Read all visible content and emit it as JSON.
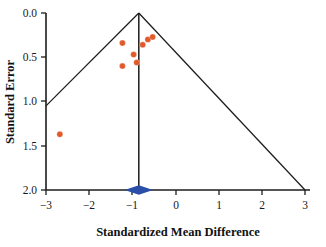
{
  "chart_data": {
    "type": "scatter",
    "title": "",
    "subtitle": "",
    "xlabel": "Standardized Mean Difference",
    "ylabel": "Standard Error",
    "xlim": [
      -3,
      3
    ],
    "ylim": [
      2.0,
      0.0
    ],
    "y_axis_inverted": true,
    "grid": false,
    "legend": false,
    "xticks": [
      -3,
      -2,
      -1,
      0,
      1,
      2,
      3
    ],
    "xticklabels": [
      "−3",
      "−2",
      "−1",
      "0",
      "1",
      "2",
      "3"
    ],
    "yticks": [
      0.0,
      0.5,
      1.0,
      1.5,
      2.0
    ],
    "yticklabels": [
      "0.0",
      "0.5",
      "1.0",
      "1.5",
      "2.0"
    ],
    "point_color": "#e05a2b",
    "point_radius": 3.0,
    "line_color": "#1c1c1c",
    "diamond_color": "#2b4fa8",
    "series": [
      {
        "name": "Studies",
        "marker": "circle",
        "color": "#e05a2b",
        "points": [
          {
            "x": -2.68,
            "y": 1.37
          },
          {
            "x": -1.23,
            "y": 0.34
          },
          {
            "x": -1.23,
            "y": 0.6
          },
          {
            "x": -0.97,
            "y": 0.47
          },
          {
            "x": -0.9,
            "y": 0.56
          },
          {
            "x": -0.76,
            "y": 0.36
          },
          {
            "x": -0.64,
            "y": 0.3
          },
          {
            "x": -0.53,
            "y": 0.27
          }
        ]
      }
    ],
    "annotations": {
      "funnel": {
        "apex_x": -0.85,
        "apex_y": 0.0,
        "left_edge_end": {
          "x": -3.0,
          "y": 1.05
        },
        "right_edge_end": {
          "x": 3.0,
          "y": 2.0
        },
        "center_line_x": -0.85
      },
      "summary_diamond": {
        "center_x": -0.85,
        "center_y": 2.0,
        "left_x": -1.18,
        "right_x": -0.52,
        "half_height": 0.055,
        "color": "#2b4fa8"
      }
    }
  }
}
